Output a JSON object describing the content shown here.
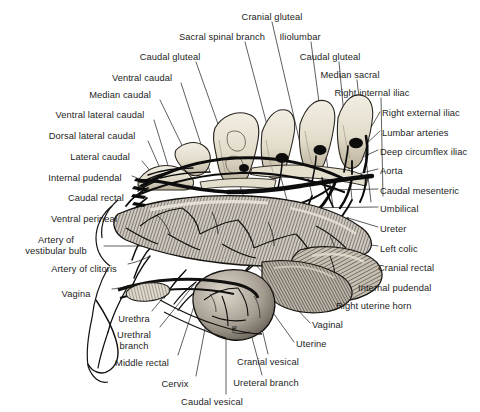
{
  "figure": {
    "style": "grayscale line engraving with stipple and hatch shading",
    "palette": {
      "background": "#ffffff",
      "ink": "#101010",
      "bone_light": "#ece7da",
      "bone_mid": "#cfc7b4",
      "bone_shadow": "#9b927e",
      "viscera_light": "#d8d2c8",
      "viscera_mid": "#9a938a",
      "viscera_dark": "#4e4a45",
      "vessel": "#0d0d0d",
      "leader_line": "#2a2a2a",
      "label_text": "#1d1d1d"
    }
  },
  "labels": [
    {
      "id": "cranial-gluteal",
      "text": "Cranial gluteal",
      "side": "top",
      "x": 272,
      "y": 12,
      "align": "center",
      "tip_x": 312,
      "tip_y": 195
    },
    {
      "id": "sacral-spinal-branch",
      "text": "Sacral spinal branch",
      "side": "top",
      "x": 222,
      "y": 32,
      "align": "center",
      "tip_x": 288,
      "tip_y": 204
    },
    {
      "id": "caudal-gluteal-left",
      "text": "Caudal gluteal",
      "side": "top",
      "x": 170,
      "y": 52,
      "align": "center",
      "tip_x": 245,
      "tip_y": 200
    },
    {
      "id": "iliolumbar",
      "text": "Iliolumbar",
      "side": "top",
      "x": 300,
      "y": 32,
      "align": "center",
      "tip_x": 333,
      "tip_y": 207
    },
    {
      "id": "caudal-gluteal-right",
      "text": "Caudal gluteal",
      "side": "top",
      "x": 330,
      "y": 52,
      "align": "center",
      "tip_x": 352,
      "tip_y": 200
    },
    {
      "id": "ventral-caudal",
      "text": "Ventral caudal",
      "side": "left",
      "x": 142,
      "y": 73,
      "align": "center",
      "tip_x": 210,
      "tip_y": 172
    },
    {
      "id": "median-sacral",
      "text": "Median sacral",
      "side": "top",
      "x": 350,
      "y": 70,
      "align": "center",
      "tip_x": 371,
      "tip_y": 202
    },
    {
      "id": "median-caudal",
      "text": "Median caudal",
      "side": "left",
      "x": 120,
      "y": 90,
      "align": "center",
      "tip_x": 193,
      "tip_y": 168
    },
    {
      "id": "right-internal-iliac",
      "text": "Right internal iliac",
      "side": "top",
      "x": 372,
      "y": 88,
      "align": "center",
      "tip_x": 383,
      "tip_y": 196
    },
    {
      "id": "ventral-lateral-caudal",
      "text": "Ventral lateral caudal",
      "side": "left",
      "x": 100,
      "y": 110,
      "align": "center",
      "tip_x": 170,
      "tip_y": 172
    },
    {
      "id": "right-external-iliac",
      "text": "Right external iliac",
      "side": "right",
      "x": 382,
      "y": 108,
      "align": "left",
      "tip_x": 366,
      "tip_y": 136
    },
    {
      "id": "dorsal-lateral-caudal",
      "text": "Dorsal lateral caudal",
      "side": "left",
      "x": 92,
      "y": 131,
      "align": "center",
      "tip_x": 163,
      "tip_y": 175
    },
    {
      "id": "lumbar-arteries",
      "text": "Lumbar arteries",
      "side": "right",
      "x": 382,
      "y": 128,
      "align": "left",
      "tip_x": 364,
      "tip_y": 146
    },
    {
      "id": "deep-circumflex-iliac",
      "text": "Deep circumflex iliac",
      "side": "right",
      "x": 380,
      "y": 147,
      "align": "left",
      "tip_x": 352,
      "tip_y": 162
    },
    {
      "id": "lateral-caudal",
      "text": "Lateral caudal",
      "side": "left",
      "x": 100,
      "y": 152,
      "align": "center",
      "tip_x": 158,
      "tip_y": 180
    },
    {
      "id": "aorta",
      "text": "Aorta",
      "side": "right",
      "x": 380,
      "y": 166,
      "align": "left",
      "tip_x": 350,
      "tip_y": 176
    },
    {
      "id": "internal-pudendal-left",
      "text": "Internal pudendal",
      "side": "left",
      "x": 85,
      "y": 173,
      "align": "center",
      "tip_x": 148,
      "tip_y": 188
    },
    {
      "id": "caudal-mesenteric",
      "text": "Caudal mesenteric",
      "side": "right",
      "x": 380,
      "y": 186,
      "align": "left",
      "tip_x": 330,
      "tip_y": 190
    },
    {
      "id": "caudal-rectal",
      "text": "Caudal rectal",
      "side": "left",
      "x": 96,
      "y": 193,
      "align": "center",
      "tip_x": 147,
      "tip_y": 198
    },
    {
      "id": "umbilical",
      "text": "Umbilical",
      "side": "right",
      "x": 380,
      "y": 204,
      "align": "left",
      "tip_x": 298,
      "tip_y": 208
    },
    {
      "id": "ventral-perineal",
      "text": "Ventral perineal",
      "side": "left",
      "x": 84,
      "y": 214,
      "align": "center",
      "tip_x": 150,
      "tip_y": 227
    },
    {
      "id": "ureter",
      "text": "Ureter",
      "side": "right",
      "x": 380,
      "y": 224,
      "align": "left",
      "tip_x": 348,
      "tip_y": 218
    },
    {
      "id": "artery-of-vestibular-bulb",
      "text": "Artery of\nvestibular bulb",
      "side": "left",
      "x": 56,
      "y": 235,
      "align": "center",
      "tip_x": 152,
      "tip_y": 246
    },
    {
      "id": "left-colic",
      "text": "Left colic",
      "side": "right",
      "x": 380,
      "y": 244,
      "align": "left",
      "tip_x": 348,
      "tip_y": 242
    },
    {
      "id": "artery-of-clitoris",
      "text": "Artery of clitoris",
      "side": "left",
      "x": 84,
      "y": 264,
      "align": "center",
      "tip_x": 150,
      "tip_y": 256
    },
    {
      "id": "cranial-rectal",
      "text": "Cranial rectal",
      "side": "right",
      "x": 378,
      "y": 263,
      "align": "left",
      "tip_x": 344,
      "tip_y": 256
    },
    {
      "id": "internal-pudendal-right",
      "text": "Internal pudendal",
      "side": "right",
      "x": 358,
      "y": 283,
      "align": "left",
      "tip_x": 310,
      "tip_y": 268
    },
    {
      "id": "vagina",
      "text": "Vagina",
      "side": "left",
      "x": 76,
      "y": 289,
      "align": "center",
      "tip_x": 128,
      "tip_y": 286
    },
    {
      "id": "right-uterine-horn",
      "text": "Right uterine horn",
      "side": "right",
      "x": 336,
      "y": 301,
      "align": "left",
      "tip_x": 300,
      "tip_y": 278
    },
    {
      "id": "vaginal",
      "text": "Vaginal",
      "side": "right",
      "x": 312,
      "y": 320,
      "align": "left",
      "tip_x": 253,
      "tip_y": 262
    },
    {
      "id": "urethra",
      "text": "Urethra",
      "side": "bottom",
      "x": 134,
      "y": 314,
      "align": "center",
      "tip_x": 186,
      "tip_y": 270
    },
    {
      "id": "uterine",
      "text": "Uterine",
      "side": "right",
      "x": 296,
      "y": 339,
      "align": "left",
      "tip_x": 244,
      "tip_y": 272
    },
    {
      "id": "urethral-branch",
      "text": "Urethral\nbranch",
      "side": "bottom",
      "x": 134,
      "y": 330,
      "align": "center",
      "tip_x": 196,
      "tip_y": 282
    },
    {
      "id": "cranial-vesical",
      "text": "Cranial vesical",
      "side": "bottom",
      "x": 268,
      "y": 357,
      "align": "center",
      "tip_x": 254,
      "tip_y": 295
    },
    {
      "id": "middle-rectal",
      "text": "Middle rectal",
      "side": "bottom",
      "x": 142,
      "y": 358,
      "align": "center",
      "tip_x": 200,
      "tip_y": 288
    },
    {
      "id": "ureteral-branch",
      "text": "Ureteral branch",
      "side": "bottom",
      "x": 266,
      "y": 378,
      "align": "center",
      "tip_x": 242,
      "tip_y": 300
    },
    {
      "id": "cervix",
      "text": "Cervix",
      "side": "bottom",
      "x": 175,
      "y": 379,
      "align": "center",
      "tip_x": 212,
      "tip_y": 292
    },
    {
      "id": "caudal-vesical",
      "text": "Caudal vesical",
      "side": "bottom",
      "x": 212,
      "y": 397,
      "align": "center",
      "tip_x": 226,
      "tip_y": 300
    }
  ]
}
